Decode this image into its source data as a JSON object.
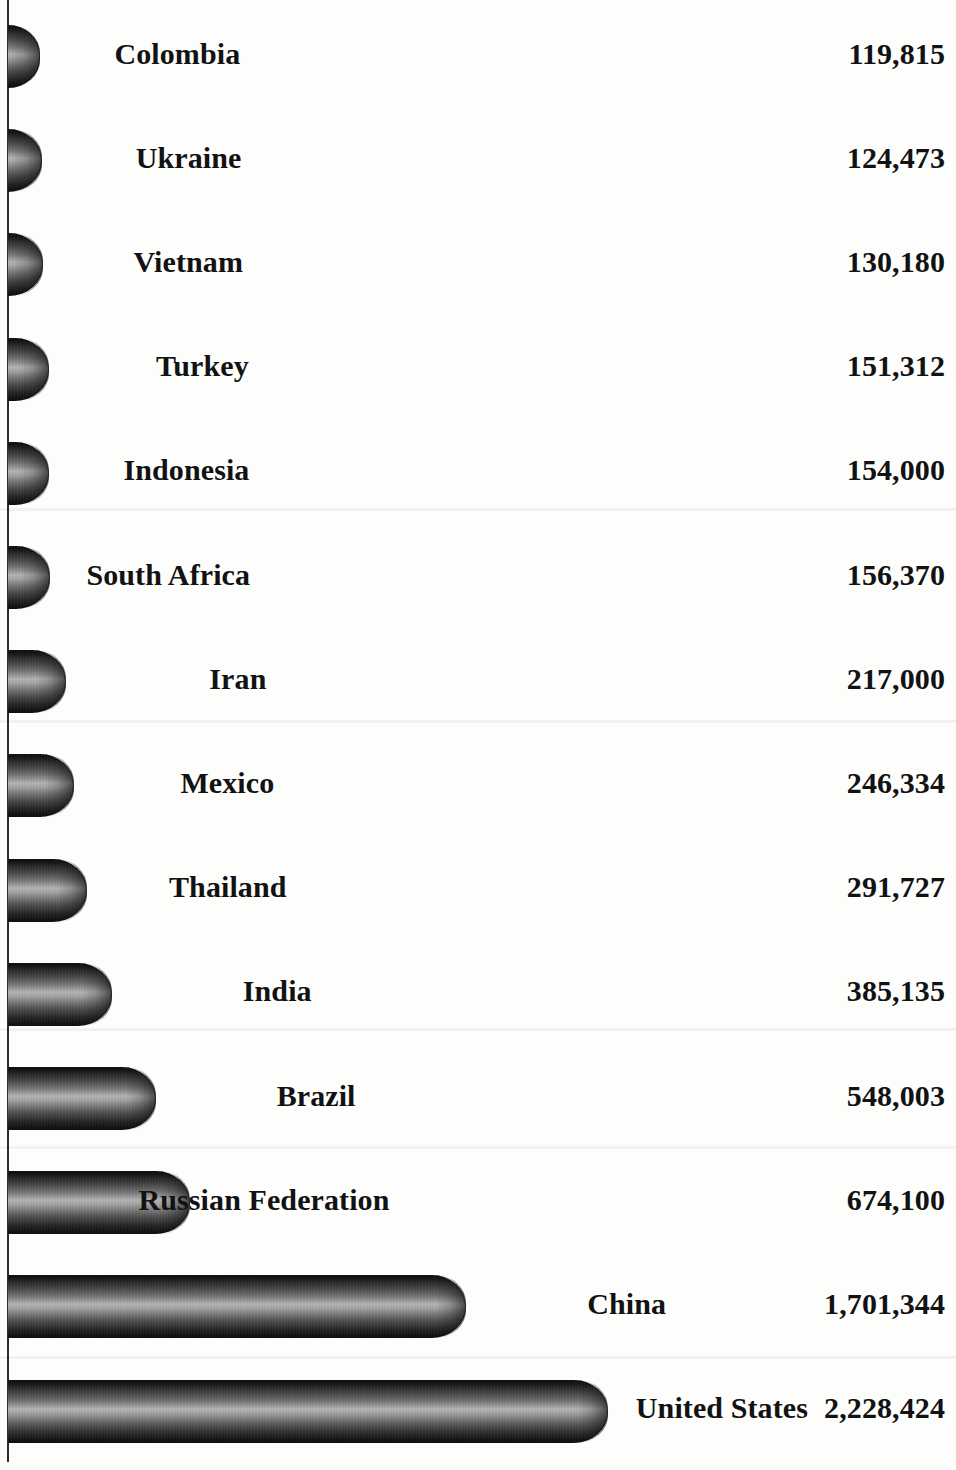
{
  "chart_data": {
    "type": "bar",
    "orientation": "horizontal",
    "title": "",
    "subtitle": "",
    "xlabel": "",
    "ylabel": "",
    "grid": false,
    "legend": null,
    "axis_line": "vertical category axis at left edge",
    "value_format": "thousands separated by comma",
    "xlim": [
      0,
      2228424
    ],
    "sort_order": "ascending by value (top to bottom)",
    "categories": [
      "Colombia",
      "Ukraine",
      "Vietnam",
      "Turkey",
      "Indonesia",
      "South Africa",
      "Iran",
      "Mexico",
      "Thailand",
      "India",
      "Brazil",
      "Russian Federation",
      "China",
      "United States"
    ],
    "values": [
      119815,
      124473,
      130180,
      151312,
      154000,
      156370,
      217000,
      246334,
      291727,
      385135,
      548003,
      674100,
      1701344,
      2228424
    ],
    "value_labels": [
      "119,815",
      "124,473",
      "130,180",
      "151,312",
      "154,000",
      "156,370",
      "217,000",
      "246,334",
      "291,727",
      "385,135",
      "548,003",
      "674,100",
      "1,701,344",
      "2,228,424"
    ],
    "style": {
      "bar_shape": "3d-cylinder",
      "bar_color_dark": "#0e0e0e",
      "bar_color_highlight": "#b4b4b4",
      "text_color": "#121212",
      "background": "#fdfdfc",
      "axis_color": "#2b2b2b"
    }
  },
  "rows": [
    {
      "category": "Colombia",
      "value_label": "119,815"
    },
    {
      "category": "Ukraine",
      "value_label": "124,473"
    },
    {
      "category": "Vietnam",
      "value_label": "130,180"
    },
    {
      "category": "Turkey",
      "value_label": "151,312"
    },
    {
      "category": "Indonesia",
      "value_label": "154,000"
    },
    {
      "category": "South Africa",
      "value_label": "156,370"
    },
    {
      "category": "Iran",
      "value_label": "217,000"
    },
    {
      "category": "Mexico",
      "value_label": "246,334"
    },
    {
      "category": "Thailand",
      "value_label": "291,727"
    },
    {
      "category": "India",
      "value_label": "385,135"
    },
    {
      "category": "Brazil",
      "value_label": "548,003"
    },
    {
      "category": "Russian Federation",
      "value_label": "674,100"
    },
    {
      "category": "China",
      "value_label": "1,701,344"
    },
    {
      "category": "United States",
      "value_label": "2,228,424"
    }
  ]
}
